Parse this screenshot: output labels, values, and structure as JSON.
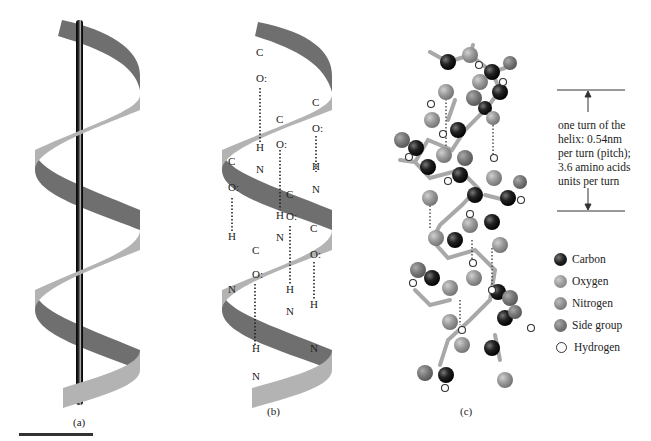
{
  "figure": {
    "panels": [
      {
        "id": "a",
        "caption": "(a)",
        "content": "helix ribbon around central axis rod"
      },
      {
        "id": "b",
        "caption": "(b)",
        "content": "helix ribbon with C=O···H–N hydrogen bonds"
      },
      {
        "id": "c",
        "caption": "(c)",
        "content": "ball-and-stick model of alpha helix"
      }
    ],
    "atoms_labels": {
      "carbon": "C",
      "oxygen": "O:",
      "hydrogen": "H",
      "nitrogen": "N"
    },
    "annotation": {
      "lines": [
        "one turn of the",
        "helix: 0.54nm",
        "per turn (pitch);",
        "3.6 amino acids",
        "units per turn"
      ]
    },
    "legend": [
      {
        "name": "Carbon",
        "key": "carbon",
        "color": "#111111"
      },
      {
        "name": "Oxygen",
        "key": "oxygen",
        "color": "#999999"
      },
      {
        "name": "Nitrogen",
        "key": "nitrogen",
        "color": "#888888"
      },
      {
        "name": "Side group",
        "key": "side",
        "color": "#6e6e6e"
      },
      {
        "name": "Hydrogen",
        "key": "hydrogen",
        "color": "#ffffff"
      }
    ],
    "colors": {
      "ribbon_light": "#b3b3b3",
      "ribbon_dark": "#6f6f6f",
      "rod": "#111111",
      "scale_bar": "#333333"
    }
  }
}
